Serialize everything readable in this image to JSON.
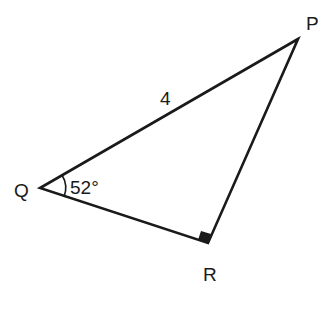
{
  "diagram": {
    "type": "right-triangle",
    "vertices": {
      "P": {
        "label": "P",
        "x": 298,
        "y": 39
      },
      "Q": {
        "label": "Q",
        "x": 40,
        "y": 188
      },
      "R": {
        "label": "R",
        "x": 208,
        "y": 243
      }
    },
    "side_labels": {
      "QP": "4"
    },
    "angle_labels": {
      "Q": "52°"
    },
    "right_angle_at": "R",
    "stroke_color": "#1a1a1a"
  }
}
